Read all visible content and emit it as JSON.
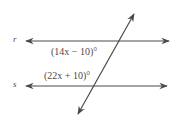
{
  "diagram": {
    "type": "parallel-lines-transversal",
    "line_color": "#4a4a4a",
    "lines": [
      {
        "id": "r",
        "label": "r"
      },
      {
        "id": "s",
        "label": "s"
      }
    ],
    "angles": [
      {
        "label": "(14x − 10)°",
        "position": "below line r, left of transversal"
      },
      {
        "label": "(22x + 10)°",
        "position": "above line s, left of transversal"
      }
    ]
  }
}
